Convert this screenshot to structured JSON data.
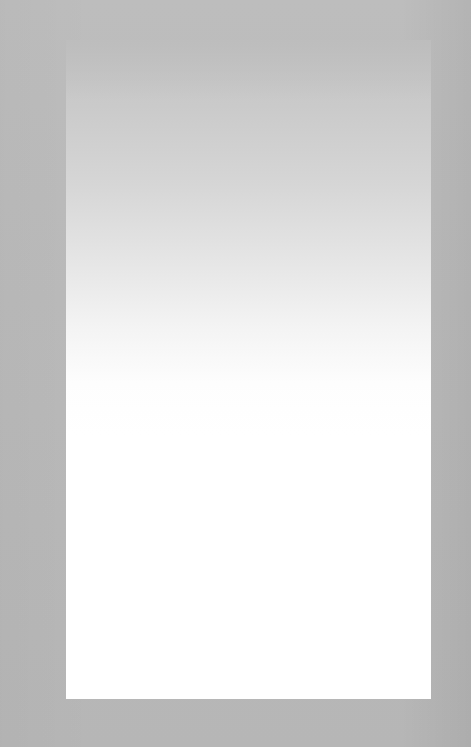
{
  "document": {
    "type": "scanned-page",
    "content": "",
    "colors": {
      "background": "#b9b9b9",
      "page": "#ffffff",
      "page_top_shade": "#c4c4c4"
    }
  }
}
